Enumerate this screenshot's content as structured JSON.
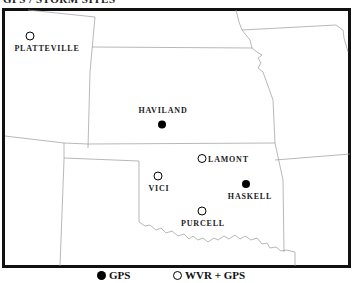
{
  "title": "GPS / STORM SITES",
  "colors": {
    "frame": "#111111",
    "state_border": "#9a9a9a",
    "gps_marker": "#000000",
    "wvr_marker_fill": "#ffffff",
    "label": "#222222"
  },
  "sites": [
    {
      "name": "PLATTEVILLE",
      "type": "WVR + GPS"
    },
    {
      "name": "HAVILAND",
      "type": "GPS"
    },
    {
      "name": "LAMONT",
      "type": "WVR + GPS"
    },
    {
      "name": "VICI",
      "type": "WVR + GPS"
    },
    {
      "name": "HASKELL",
      "type": "GPS"
    },
    {
      "name": "PURCELL",
      "type": "WVR + GPS"
    }
  ],
  "legend": {
    "gps": {
      "label": "GPS",
      "icon": "filled-circle-icon"
    },
    "wvr_gps": {
      "label": "WVR + GPS",
      "icon": "open-circle-icon"
    }
  }
}
